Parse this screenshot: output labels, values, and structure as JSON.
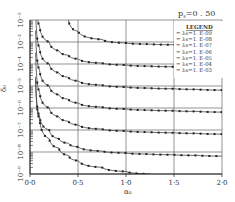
{
  "chart_data": {
    "type": "line",
    "xlabel": "α0",
    "ylabel": "δ0",
    "xlim": [
      0.0,
      2.0
    ],
    "ylim": [
      1e-09,
      0.01
    ],
    "yscale": "log",
    "grid": true,
    "x_ticks": [
      "0·0",
      "0·5",
      "1·0",
      "1·5",
      "2·0"
    ],
    "y_ticks": [
      "10⁻²",
      "10⁻³",
      "10⁻⁴",
      "10⁻⁵",
      "10⁻⁶",
      "10⁻⁷",
      "10⁻⁸",
      "10⁻⁹"
    ],
    "legend_title": "LEGEND",
    "legend_position": "upper right",
    "x": [
      0.1,
      0.2,
      0.3,
      0.4,
      0.5,
      0.75,
      1.0,
      1.25,
      1.5,
      1.75,
      2.0
    ],
    "series": [
      {
        "name": "λs=1.E-09",
        "values": [
          3e-07,
          4e-08,
          1.5e-08,
          7e-09,
          4e-09,
          2e-09,
          1.3e-09,
          1e-09,
          null,
          null,
          null
        ]
      },
      {
        "name": "λs=1.E-08",
        "values": [
          4e-07,
          1e-07,
          4e-08,
          2.5e-08,
          1.7e-08,
          1.1e-08,
          9e-09,
          8e-09,
          7.5e-09,
          7e-09,
          6.5e-09
        ]
      },
      {
        "name": "λs=1.E-07",
        "values": [
          5e-06,
          1e-06,
          4e-07,
          2.5e-07,
          1.7e-07,
          1.1e-07,
          9e-08,
          8e-08,
          7.5e-08,
          7e-08,
          6.5e-08
        ]
      },
      {
        "name": "λs=1.E-06",
        "values": [
          5e-05,
          1e-05,
          4e-06,
          2.5e-06,
          1.7e-06,
          1.1e-06,
          9e-07,
          8e-07,
          7.5e-07,
          7e-07,
          6.5e-07
        ]
      },
      {
        "name": "λs=1.E-05",
        "values": [
          0.0005,
          0.0001,
          4e-05,
          2.5e-05,
          1.7e-05,
          1.1e-05,
          9e-06,
          8e-06,
          7.5e-06,
          7e-06,
          6.5e-06
        ]
      },
      {
        "name": "λs=1.E-04",
        "values": [
          0.005,
          0.001,
          0.0004,
          0.00025,
          0.00017,
          0.00011,
          9e-05,
          8e-05,
          7.5e-05,
          7e-05,
          6.5e-05
        ]
      },
      {
        "name": "λs=1.E-03",
        "values": [
          null,
          null,
          null,
          0.01,
          0.003,
          0.0013,
          0.0009,
          0.0008,
          0.00075,
          0.0007,
          0.00065
        ]
      }
    ]
  },
  "labels": {
    "title": "p",
    "title_sub": "s",
    "title_val": "=0 . 50",
    "legend_title": "LEGEND",
    "legend_items": [
      "=  λs=1. E-09",
      "=  λs=1. E-08",
      "=  λs=1. E-07",
      "=  λs=1. E-06",
      "=  λs=1. E-05",
      "=  λs=1. E-04",
      "=  λs=1. E-03"
    ],
    "x_ticks": [
      "0·0",
      "0·5",
      "1·0",
      "1·5",
      "2·0"
    ],
    "y_ticks": [
      "10⁻²",
      "10⁻³",
      "10⁻⁴",
      "10⁻⁵",
      "10⁻⁶",
      "10⁻⁷",
      "10⁻⁸",
      "10⁻⁹"
    ],
    "xlabel": "α₀",
    "ylabel": "δ₀"
  }
}
